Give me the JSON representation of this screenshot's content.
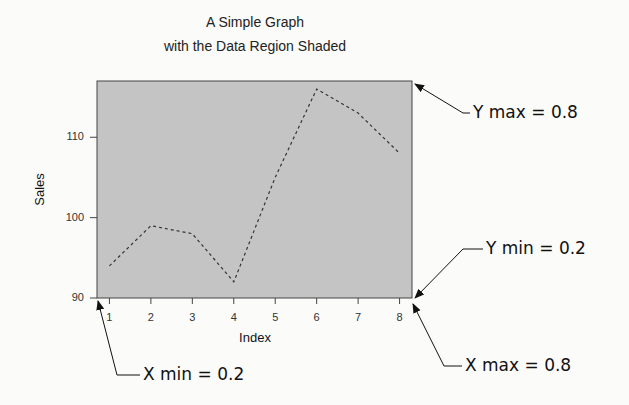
{
  "chart_data": {
    "type": "line",
    "title": "A Simple Graph",
    "subtitle": "with the Data Region Shaded",
    "xlabel": "Index",
    "ylabel": "Sales",
    "x": [
      1,
      2,
      3,
      4,
      5,
      6,
      7,
      8
    ],
    "series": [
      {
        "name": "Sales",
        "values": [
          94,
          99,
          98,
          92,
          105,
          116,
          113,
          108
        ],
        "line_style": "dashed"
      }
    ],
    "xticks": [
      "1",
      "2",
      "3",
      "4",
      "5",
      "6",
      "7",
      "8"
    ],
    "yticks": [
      "90",
      "100",
      "110"
    ],
    "xlim": [
      0.7,
      8.3
    ],
    "ylim": [
      90,
      117
    ],
    "grid": false,
    "plot_region_fill": "#c4c4c4",
    "annotations": [
      {
        "label": "Y max = 0.8",
        "points_to": "top-right corner of plot region"
      },
      {
        "label": "Y min = 0.2",
        "points_to": "bottom-right corner of plot region"
      },
      {
        "label": "X max = 0.8",
        "points_to": "bottom-right corner of plot region"
      },
      {
        "label": "X min = 0.2",
        "points_to": "bottom-left corner of plot region"
      }
    ]
  },
  "annotations": {
    "ymax": "Y max = 0.8",
    "ymin": "Y min = 0.2",
    "xmax": "X max = 0.8",
    "xmin": "X min = 0.2"
  }
}
